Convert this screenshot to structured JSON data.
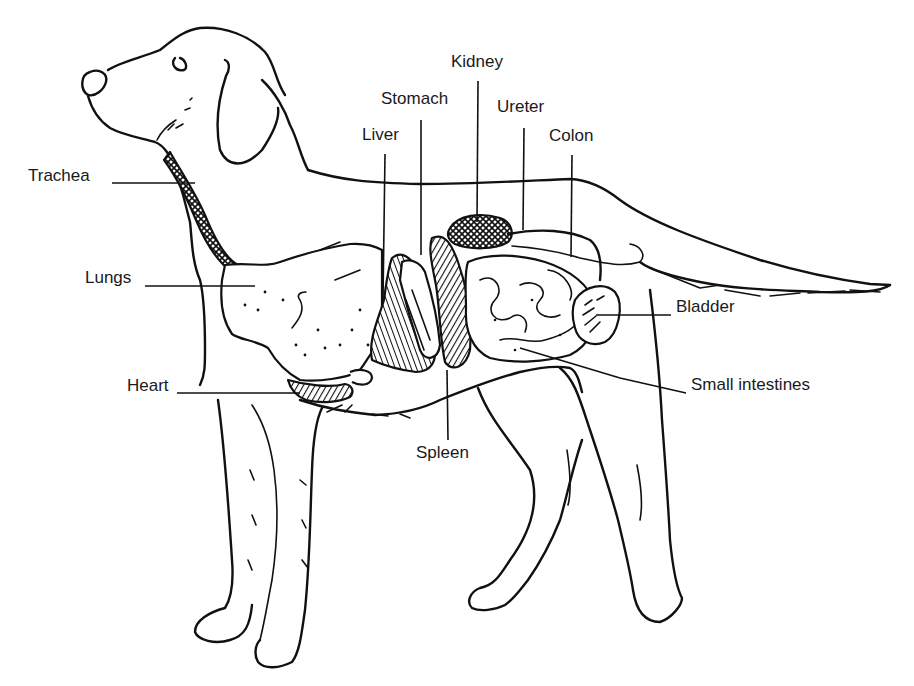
{
  "diagram": {
    "labels": [
      {
        "id": "trachea",
        "text": "Trachea",
        "x": 28,
        "y": 175
      },
      {
        "id": "lungs",
        "text": "Lungs",
        "x": 85,
        "y": 277
      },
      {
        "id": "heart",
        "text": "Heart",
        "x": 127,
        "y": 385
      },
      {
        "id": "liver",
        "text": "Liver",
        "x": 362,
        "y": 134
      },
      {
        "id": "stomach",
        "text": "Stomach",
        "x": 381,
        "y": 98
      },
      {
        "id": "kidney",
        "text": "Kidney",
        "x": 451,
        "y": 61
      },
      {
        "id": "ureter",
        "text": "Ureter",
        "x": 497,
        "y": 106
      },
      {
        "id": "colon",
        "text": "Colon",
        "x": 549,
        "y": 135
      },
      {
        "id": "bladder",
        "text": "Bladder",
        "x": 676,
        "y": 306
      },
      {
        "id": "small_intestines",
        "text": "Small intestines",
        "x": 691,
        "y": 384
      },
      {
        "id": "spleen",
        "text": "Spleen",
        "x": 416,
        "y": 452
      }
    ],
    "leaders": [
      {
        "id": "trachea",
        "points": "112,183 195,183"
      },
      {
        "id": "lungs",
        "points": "145,286 255,286"
      },
      {
        "id": "heart",
        "points": "177,393 300,393"
      },
      {
        "id": "liver",
        "points": "385,154 383,300"
      },
      {
        "id": "stomach",
        "points": "421,120 421,255"
      },
      {
        "id": "kidney",
        "points": "478,81 477,222"
      },
      {
        "id": "ureter",
        "points": "524,128 523,230"
      },
      {
        "id": "colon",
        "points": "572,155 571,257"
      },
      {
        "id": "bladder",
        "points": "596,315 671,315"
      },
      {
        "id": "small_intestines",
        "points": "520,348 620,378 686,393"
      },
      {
        "id": "spleen",
        "points": "447,370 448,440"
      }
    ],
    "colors": {
      "ink": "#111111",
      "label_text": "#1a1a1a",
      "background": "#ffffff"
    }
  }
}
